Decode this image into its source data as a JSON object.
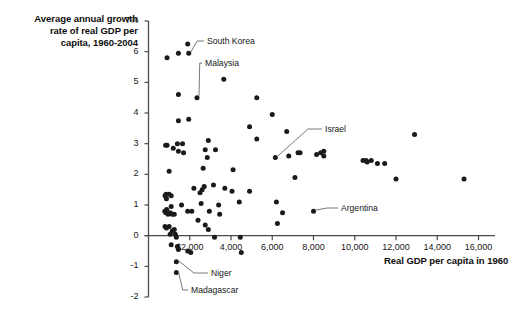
{
  "chart_data": {
    "type": "scatter",
    "title": "Average annual growth rate of real GDP per capita, 1960-2004",
    "title_lines": [
      "Average annual growth",
      "rate of real GDP per",
      "capita, 1960-2004"
    ],
    "xlabel": "Real GDP per capita in 1960",
    "ylabel": "Average annual growth rate of real GDP per capita, 1960-2004",
    "xlim": [
      0,
      16800
    ],
    "ylim": [
      -2,
      7
    ],
    "grid": false,
    "legend": "none",
    "y_axis_unit": "%",
    "y_top_label": "7%",
    "xticks": [
      2000,
      4000,
      6000,
      8000,
      10000,
      12000,
      14000,
      16000
    ],
    "xtick_labels": [
      "$2,000",
      "4,000",
      "6,000",
      "8,000",
      "10,000",
      "12,000",
      "14,000",
      "16,000"
    ],
    "yticks": [
      -2,
      -1,
      0,
      1,
      2,
      3,
      4,
      5,
      6,
      7
    ],
    "ytick_labels": [
      "-2",
      "-1",
      "0",
      "1",
      "2",
      "3",
      "4",
      "5",
      "6",
      "7%"
    ],
    "marker": "filled-circle",
    "marker_color": "#1a1a1a",
    "axis_color": "#4a4a4a",
    "points": [
      {
        "x": 900,
        "y": 5.8
      },
      {
        "x": 1450,
        "y": 5.95
      },
      {
        "x": 1900,
        "y": 6.25
      },
      {
        "x": 1950,
        "y": 5.95
      },
      {
        "x": 3650,
        "y": 5.1
      },
      {
        "x": 1450,
        "y": 4.6
      },
      {
        "x": 2350,
        "y": 4.5
      },
      {
        "x": 5250,
        "y": 4.5
      },
      {
        "x": 6000,
        "y": 3.95
      },
      {
        "x": 1450,
        "y": 3.75
      },
      {
        "x": 1950,
        "y": 3.8
      },
      {
        "x": 4900,
        "y": 3.55
      },
      {
        "x": 6700,
        "y": 3.4
      },
      {
        "x": 12900,
        "y": 3.3
      },
      {
        "x": 2900,
        "y": 3.1
      },
      {
        "x": 5250,
        "y": 3.15
      },
      {
        "x": 830,
        "y": 2.95
      },
      {
        "x": 900,
        "y": 2.95
      },
      {
        "x": 1400,
        "y": 3.0
      },
      {
        "x": 1650,
        "y": 3.0
      },
      {
        "x": 1200,
        "y": 2.85
      },
      {
        "x": 1450,
        "y": 2.75
      },
      {
        "x": 1700,
        "y": 2.7
      },
      {
        "x": 2750,
        "y": 2.8
      },
      {
        "x": 3250,
        "y": 2.8
      },
      {
        "x": 2850,
        "y": 2.55
      },
      {
        "x": 6150,
        "y": 2.55
      },
      {
        "x": 6800,
        "y": 2.6
      },
      {
        "x": 7250,
        "y": 2.7
      },
      {
        "x": 7350,
        "y": 2.7
      },
      {
        "x": 8150,
        "y": 2.65
      },
      {
        "x": 8350,
        "y": 2.7
      },
      {
        "x": 8500,
        "y": 2.75
      },
      {
        "x": 8500,
        "y": 2.6
      },
      {
        "x": 10400,
        "y": 2.45
      },
      {
        "x": 10550,
        "y": 2.45
      },
      {
        "x": 10600,
        "y": 2.4
      },
      {
        "x": 10800,
        "y": 2.45
      },
      {
        "x": 11100,
        "y": 2.35
      },
      {
        "x": 11450,
        "y": 2.35
      },
      {
        "x": 1000,
        "y": 2.1
      },
      {
        "x": 2650,
        "y": 2.2
      },
      {
        "x": 4100,
        "y": 2.15
      },
      {
        "x": 7100,
        "y": 1.9
      },
      {
        "x": 12000,
        "y": 1.85
      },
      {
        "x": 15300,
        "y": 1.85
      },
      {
        "x": 800,
        "y": 1.3
      },
      {
        "x": 850,
        "y": 1.35
      },
      {
        "x": 870,
        "y": 1.2
      },
      {
        "x": 1000,
        "y": 1.35
      },
      {
        "x": 1100,
        "y": 1.3
      },
      {
        "x": 2200,
        "y": 1.55
      },
      {
        "x": 2600,
        "y": 1.5
      },
      {
        "x": 2700,
        "y": 1.6
      },
      {
        "x": 3150,
        "y": 1.65
      },
      {
        "x": 3700,
        "y": 1.55
      },
      {
        "x": 4050,
        "y": 1.45
      },
      {
        "x": 4900,
        "y": 1.45
      },
      {
        "x": 2500,
        "y": 1.4
      },
      {
        "x": 1100,
        "y": 0.95
      },
      {
        "x": 1600,
        "y": 1.0
      },
      {
        "x": 2550,
        "y": 1.05
      },
      {
        "x": 3400,
        "y": 1.0
      },
      {
        "x": 4400,
        "y": 1.1
      },
      {
        "x": 6200,
        "y": 1.1
      },
      {
        "x": 790,
        "y": 0.8
      },
      {
        "x": 840,
        "y": 0.75
      },
      {
        "x": 880,
        "y": 0.85
      },
      {
        "x": 950,
        "y": 0.7
      },
      {
        "x": 1050,
        "y": 0.75
      },
      {
        "x": 1150,
        "y": 0.7
      },
      {
        "x": 1250,
        "y": 0.7
      },
      {
        "x": 1900,
        "y": 0.8
      },
      {
        "x": 2100,
        "y": 0.8
      },
      {
        "x": 2950,
        "y": 0.8
      },
      {
        "x": 3450,
        "y": 0.7
      },
      {
        "x": 6500,
        "y": 0.75
      },
      {
        "x": 8000,
        "y": 0.8
      },
      {
        "x": 2400,
        "y": 0.5
      },
      {
        "x": 2750,
        "y": 0.35
      },
      {
        "x": 6250,
        "y": 0.4
      },
      {
        "x": 800,
        "y": 0.3
      },
      {
        "x": 870,
        "y": 0.25
      },
      {
        "x": 1000,
        "y": 0.3
      },
      {
        "x": 1150,
        "y": 0.15
      },
      {
        "x": 1250,
        "y": 0.2
      },
      {
        "x": 2900,
        "y": 0.2
      },
      {
        "x": 1050,
        "y": 0.05
      },
      {
        "x": 1300,
        "y": 0.05
      },
      {
        "x": 1350,
        "y": -0.05
      },
      {
        "x": 3200,
        "y": -0.05
      },
      {
        "x": 4450,
        "y": -0.05
      },
      {
        "x": 1100,
        "y": -0.3
      },
      {
        "x": 1400,
        "y": -0.35
      },
      {
        "x": 1450,
        "y": -0.45
      },
      {
        "x": 1900,
        "y": -0.5
      },
      {
        "x": 2050,
        "y": -0.55
      },
      {
        "x": 4500,
        "y": -0.55
      },
      {
        "x": 1350,
        "y": -0.85
      },
      {
        "x": 1350,
        "y": -1.2
      }
    ],
    "annotations": [
      {
        "label": "South Korea",
        "point_x": 1950,
        "point_y": 5.95,
        "text_x": 207,
        "text_y": 36
      },
      {
        "label": "Malaysia",
        "point_x": 2350,
        "point_y": 4.5,
        "text_x": 205,
        "text_y": 58
      },
      {
        "label": "Israel",
        "point_x": 6150,
        "point_y": 2.55,
        "text_x": 325,
        "text_y": 124
      },
      {
        "label": "Argentina",
        "point_x": 8000,
        "point_y": 0.8,
        "text_x": 341,
        "text_y": 203
      },
      {
        "label": "Niger",
        "point_x": 1350,
        "point_y": -0.85,
        "text_x": 211,
        "text_y": 268
      },
      {
        "label": "Madagascar",
        "point_x": 1350,
        "point_y": -1.2,
        "text_x": 191,
        "text_y": 285
      }
    ]
  }
}
